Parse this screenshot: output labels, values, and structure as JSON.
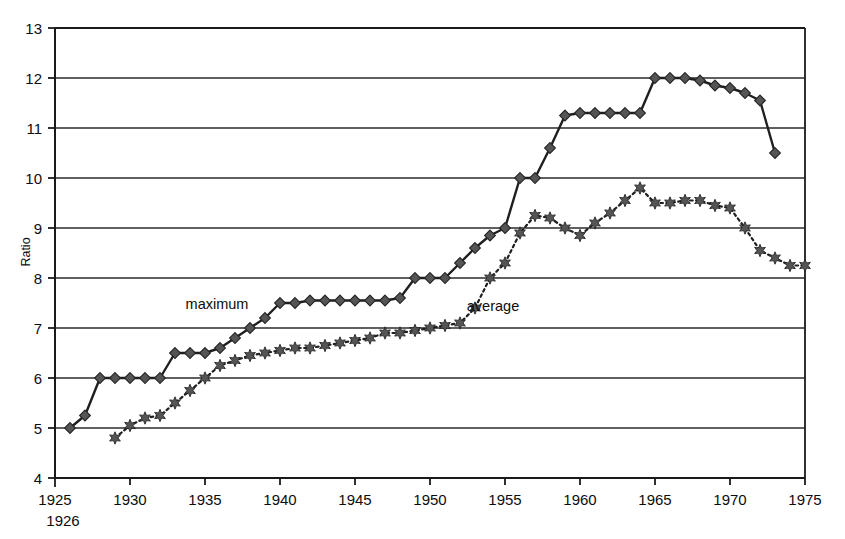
{
  "chart_data": {
    "type": "line",
    "title": "",
    "xlabel": "",
    "ylabel": "Ratio",
    "xlim": [
      1925,
      1975
    ],
    "ylim": [
      4,
      13
    ],
    "grid": true,
    "legend_position": "inline-annotation",
    "x_ticks": [
      1925,
      1930,
      1935,
      1940,
      1945,
      1950,
      1955,
      1960,
      1965,
      1970,
      1975
    ],
    "x_tick_labels": [
      "1925",
      "1930",
      "1935",
      "1940",
      "1945",
      "1950",
      "1955",
      "1960",
      "1965",
      "1970",
      "1975"
    ],
    "x_sub_label": "1926",
    "y_ticks": [
      4,
      5,
      6,
      7,
      8,
      9,
      10,
      11,
      12,
      13
    ],
    "y_tick_labels": [
      "4",
      "5",
      "6",
      "7",
      "8",
      "9",
      "10",
      "11",
      "12",
      "13"
    ],
    "series": [
      {
        "name": "maximum",
        "marker": "diamond",
        "line_style": "solid",
        "annotation": "maximum",
        "annotation_x": 1935.8,
        "annotation_y": 7.38,
        "x": [
          1926,
          1927,
          1928,
          1929,
          1930,
          1931,
          1932,
          1933,
          1934,
          1935,
          1936,
          1937,
          1938,
          1939,
          1940,
          1941,
          1942,
          1943,
          1944,
          1945,
          1946,
          1947,
          1948,
          1949,
          1950,
          1951,
          1952,
          1953,
          1954,
          1955,
          1956,
          1957,
          1958,
          1959,
          1960,
          1961,
          1962,
          1963,
          1964,
          1965,
          1966,
          1967,
          1968,
          1969,
          1970,
          1971,
          1972,
          1973
        ],
        "y": [
          5.0,
          5.25,
          6.0,
          6.0,
          6.0,
          6.0,
          6.0,
          6.5,
          6.5,
          6.5,
          6.6,
          6.8,
          7.0,
          7.2,
          7.5,
          7.5,
          7.55,
          7.55,
          7.55,
          7.55,
          7.55,
          7.55,
          7.6,
          8.0,
          8.0,
          8.0,
          8.3,
          8.6,
          8.85,
          9.0,
          10.0,
          10.0,
          10.6,
          11.25,
          11.3,
          11.3,
          11.3,
          11.3,
          11.3,
          12.0,
          12.0,
          12.0,
          11.95,
          11.85,
          11.8,
          11.7,
          11.55,
          10.5
        ]
      },
      {
        "name": "average",
        "marker": "star",
        "line_style": "dotted",
        "annotation": "average",
        "annotation_x": 1954.2,
        "annotation_y": 7.35,
        "x": [
          1929,
          1930,
          1931,
          1932,
          1933,
          1934,
          1935,
          1936,
          1937,
          1938,
          1939,
          1940,
          1941,
          1942,
          1943,
          1944,
          1945,
          1946,
          1947,
          1948,
          1949,
          1950,
          1951,
          1952,
          1953,
          1954,
          1955,
          1956,
          1957,
          1958,
          1959,
          1960,
          1961,
          1962,
          1963,
          1964,
          1965,
          1966,
          1967,
          1968,
          1969,
          1970,
          1971,
          1972,
          1973,
          1974,
          1975
        ],
        "y": [
          4.8,
          5.05,
          5.2,
          5.25,
          5.5,
          5.75,
          6.0,
          6.25,
          6.35,
          6.45,
          6.5,
          6.55,
          6.6,
          6.6,
          6.65,
          6.7,
          6.75,
          6.8,
          6.9,
          6.9,
          6.95,
          7.0,
          7.05,
          7.1,
          7.4,
          8.0,
          8.3,
          8.9,
          9.25,
          9.2,
          9.0,
          8.85,
          9.1,
          9.3,
          9.55,
          9.8,
          9.5,
          9.5,
          9.55,
          9.55,
          9.45,
          9.4,
          9.0,
          8.55,
          8.4,
          8.25,
          8.25
        ]
      }
    ]
  }
}
